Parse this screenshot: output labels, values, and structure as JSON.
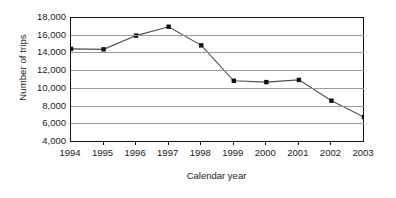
{
  "chart_data": {
    "type": "line",
    "title": "",
    "subtitle": "",
    "xlabel": "Calendar year",
    "ylabel": "Number of trips",
    "categories": [
      "1994",
      "1995",
      "1996",
      "1997",
      "1998",
      "1999",
      "2000",
      "2001",
      "2002",
      "2003"
    ],
    "values": [
      14400,
      14350,
      15900,
      16900,
      14800,
      10800,
      10650,
      10900,
      8550,
      6700
    ],
    "series": [
      {
        "name": "Number of trips",
        "values": [
          14400,
          14350,
          15900,
          16900,
          14800,
          10800,
          10650,
          10900,
          8550,
          6700
        ]
      }
    ],
    "ylim": [
      4000,
      18000
    ],
    "ytick_step": 2000,
    "ytick_labels": [
      "18,000",
      "16,000",
      "14,000",
      "12,000",
      "10,000",
      "8,000",
      "6,000",
      "4,000"
    ],
    "ytick_values": [
      18000,
      16000,
      14000,
      12000,
      10000,
      8000,
      6000,
      4000
    ],
    "xtick_labels": [
      "1994",
      "1995",
      "1996",
      "1997",
      "1998",
      "1999",
      "2000",
      "2001",
      "2002",
      "2003"
    ],
    "grid": "horizontal",
    "legend": "none",
    "marker": "square",
    "colors": {
      "line": "#4d4d4d",
      "marker": "#111111",
      "grid": "#9a9a9a",
      "axis": "#111111",
      "text": "#1a1a1a",
      "background": "#ffffff"
    }
  }
}
